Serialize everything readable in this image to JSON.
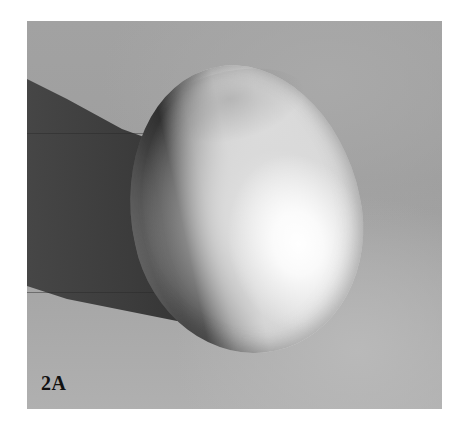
{
  "figure": {
    "label": "2A",
    "colors": {
      "page_background": "#ffffff",
      "backdrop": "#a2a2a2",
      "shadow": "#3c3c3c",
      "egg_highlight": "#ffffff",
      "label_text": "#111111"
    }
  }
}
